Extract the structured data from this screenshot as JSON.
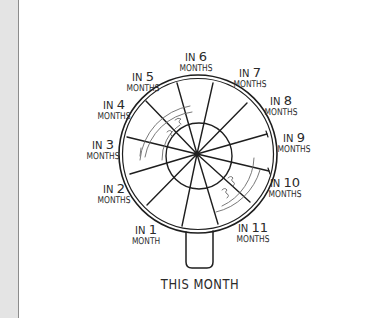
{
  "diagram": {
    "type": "hand-drawn wheel / magnifying-glass planner",
    "handle_label": "THIS MONTH",
    "segments": [
      {
        "prefix": "IN",
        "number": "1",
        "unit": "MONTH"
      },
      {
        "prefix": "IN",
        "number": "2",
        "unit": "MONTHS"
      },
      {
        "prefix": "IN",
        "number": "3",
        "unit": "MONTHS"
      },
      {
        "prefix": "IN",
        "number": "4",
        "unit": "MONTHS"
      },
      {
        "prefix": "IN",
        "number": "5",
        "unit": "MONTHS"
      },
      {
        "prefix": "IN",
        "number": "6",
        "unit": "MONTHS"
      },
      {
        "prefix": "IN",
        "number": "7",
        "unit": "MONTHS"
      },
      {
        "prefix": "IN",
        "number": "8",
        "unit": "MONTHS"
      },
      {
        "prefix": "IN",
        "number": "9",
        "unit": "MONTHS"
      },
      {
        "prefix": "IN",
        "number": "10",
        "unit": "MONTHS"
      },
      {
        "prefix": "IN",
        "number": "11",
        "unit": "MONTHS"
      }
    ],
    "colors": {
      "ink": "#1e1e1e",
      "faint_ink": "#6a6a6a",
      "background": "#ffffff",
      "margin": "#e4e4e4"
    }
  }
}
